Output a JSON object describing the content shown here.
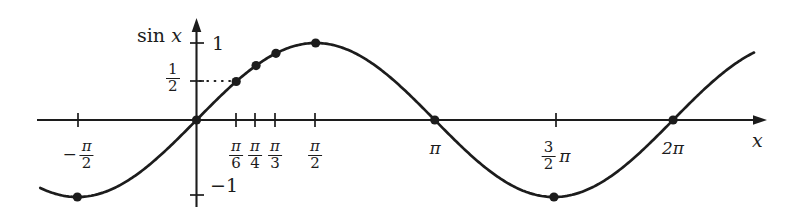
{
  "chart_data": {
    "type": "line",
    "title": "",
    "xlabel": "x",
    "ylabel": "sin x",
    "function": "y = sin x",
    "xlim_radians": [
      -2.06,
      7.35
    ],
    "ylim": [
      -1.15,
      1.15
    ],
    "grid": false,
    "legend": "none",
    "x_axis": {
      "label": "x",
      "ticks": [
        {
          "id": "neg-pi-2",
          "value_radians": -1.5708,
          "label_text": "-pi/2",
          "numerator": "π",
          "denominator": "2",
          "has_minus": true,
          "pixel_x": 78
        },
        {
          "id": "pi-6",
          "value_radians": 0.5236,
          "label_text": "pi/6",
          "numerator": "π",
          "denominator": "6",
          "has_minus": false,
          "pixel_x": 236
        },
        {
          "id": "pi-4",
          "value_radians": 0.7854,
          "label_text": "pi/4",
          "numerator": "π",
          "denominator": "4",
          "has_minus": false,
          "pixel_x": 255
        },
        {
          "id": "pi-3",
          "value_radians": 1.0472,
          "label_text": "pi/3",
          "numerator": "π",
          "denominator": "3",
          "has_minus": false,
          "pixel_x": 275
        },
        {
          "id": "pi-2",
          "value_radians": 1.5708,
          "label_text": "pi/2",
          "numerator": "π",
          "denominator": "2",
          "has_minus": false,
          "pixel_x": 315
        },
        {
          "id": "pi",
          "value_radians": 3.1416,
          "label_text": "π",
          "plain": "π",
          "pixel_x": 435
        },
        {
          "id": "3pi-2",
          "value_radians": 4.7124,
          "label_text": "3/2 pi",
          "numerator": "3",
          "denominator": "2",
          "suffix": "π",
          "pixel_x": 556
        },
        {
          "id": "2pi",
          "value_radians": 6.2832,
          "label_text": "2π",
          "plain": "2π",
          "pixel_x": 673
        }
      ]
    },
    "y_axis": {
      "label": "sin x",
      "label_sin": "sin",
      "label_var": "x",
      "ticks": [
        {
          "id": "one",
          "value": 1,
          "label_text": "1",
          "plain": "1",
          "pixel_y": 43
        },
        {
          "id": "half",
          "value": 0.5,
          "label_text": "1/2",
          "numerator": "1",
          "denominator": "2",
          "pixel_y": 81
        },
        {
          "id": "neg-one",
          "value": -1,
          "label_text": "-1",
          "plain": "−1",
          "pixel_y": 195
        }
      ]
    },
    "marked_points": [
      {
        "x_label": "-pi/2",
        "x_radians": -1.5708,
        "y": -1
      },
      {
        "x_label": "0",
        "x_radians": 0,
        "y": 0
      },
      {
        "x_label": "pi/6",
        "x_radians": 0.5236,
        "y": 0.5
      },
      {
        "x_label": "pi/4",
        "x_radians": 0.7854,
        "y": 0.7071
      },
      {
        "x_label": "pi/3",
        "x_radians": 1.0472,
        "y": 0.866
      },
      {
        "x_label": "pi/2",
        "x_radians": 1.5708,
        "y": 1
      },
      {
        "x_label": "pi",
        "x_radians": 3.1416,
        "y": 0
      },
      {
        "x_label": "3/2 pi",
        "x_radians": 4.7124,
        "y": -1
      },
      {
        "x_label": "2pi",
        "x_radians": 6.2832,
        "y": 0
      }
    ],
    "guide_lines": [
      {
        "id": "half-dotted",
        "style": "dotted",
        "from_x_radians": 0,
        "to_x_radians": 0.5236,
        "at_y": 0.5
      }
    ],
    "colors": {
      "curve": "#1c1c1c",
      "axis": "#1c1c1c",
      "point": "#1c1c1c",
      "background": "#ffffff",
      "text": "#1c1c1c"
    }
  }
}
